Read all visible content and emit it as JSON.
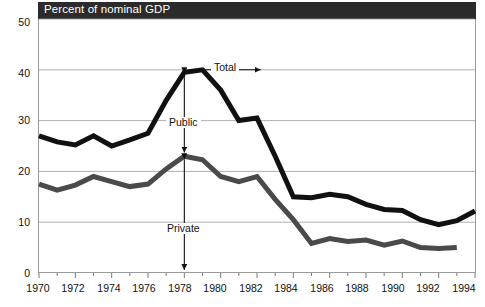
{
  "header": {
    "title": "Percent of nominal GDP",
    "band_color": "#2b2b2b",
    "text_color": "#ffffff"
  },
  "annotations": {
    "total": "Total",
    "public": "Public",
    "private": "Private"
  },
  "colors": {
    "total_series": "#111111",
    "private_series": "#4a4a4a",
    "gridline": "#9a9a9a",
    "axis": "#555555",
    "background": "#ffffff"
  },
  "chart_data": {
    "type": "line",
    "title": "Percent of nominal GDP",
    "xlabel": "",
    "ylabel": "Percent of nominal GDP",
    "xlim": [
      1970,
      1994
    ],
    "ylim": [
      0,
      50
    ],
    "yticks": [
      0,
      10,
      20,
      30,
      40,
      50
    ],
    "xticks": [
      1970,
      1972,
      1974,
      1976,
      1978,
      1980,
      1982,
      1984,
      1986,
      1988,
      1990,
      1992,
      1994
    ],
    "xtick_minor_step": 1,
    "grid": "horizontal",
    "legend": "inline-annotations",
    "annotations": [
      {
        "text": "Total",
        "type": "arrow-left",
        "points_to_year": 1978,
        "points_to_value": 40
      },
      {
        "text": "Public",
        "type": "double-arrow-vertical",
        "at_year": 1978,
        "from_value": 40,
        "to_value": 23
      },
      {
        "text": "Private",
        "type": "double-arrow-vertical",
        "at_year": 1978,
        "from_value": 23,
        "to_value": 0
      }
    ],
    "x": [
      1970,
      1971,
      1972,
      1973,
      1974,
      1975,
      1976,
      1977,
      1978,
      1979,
      1980,
      1981,
      1982,
      1983,
      1984,
      1985,
      1986,
      1987,
      1988,
      1989,
      1990,
      1991,
      1992,
      1993,
      1994
    ],
    "series": [
      {
        "name": "Total",
        "color": "#111111",
        "values": [
          27.0,
          25.8,
          25.2,
          27.0,
          25.0,
          26.2,
          27.5,
          34.0,
          39.5,
          40.0,
          36.0,
          30.0,
          30.5,
          23.0,
          15.0,
          14.8,
          15.5,
          15.0,
          13.5,
          12.5,
          12.3,
          10.5,
          9.5,
          10.3,
          12.2
        ]
      },
      {
        "name": "Private",
        "color": "#4a4a4a",
        "values": [
          17.5,
          16.3,
          17.3,
          19.0,
          18.0,
          17.0,
          17.5,
          20.5,
          23.0,
          22.3,
          19.0,
          18.0,
          19.0,
          14.5,
          10.5,
          5.8,
          6.8,
          6.2,
          6.5,
          5.5,
          6.3,
          5.0,
          4.8,
          5.0,
          null
        ]
      }
    ]
  }
}
